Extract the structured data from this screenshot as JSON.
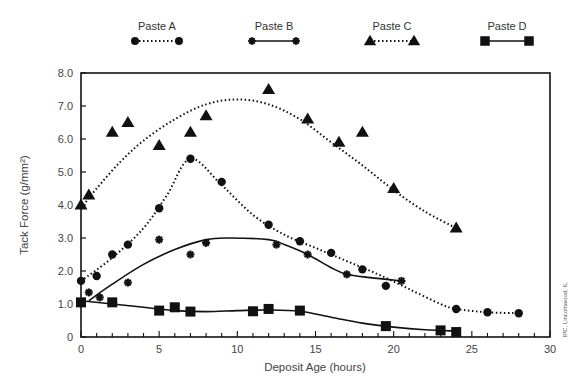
{
  "chart_data": {
    "type": "scatter",
    "title": "",
    "xlabel": "Deposit Age (hours)",
    "ylabel": "Tack Force (g/mm²)",
    "xlim": [
      0,
      30
    ],
    "ylim": [
      0,
      8.0
    ],
    "xticks": [
      0,
      5,
      10,
      15,
      20,
      25,
      30
    ],
    "xtick_labels": [
      "0",
      "5",
      "10",
      "15",
      "20",
      "25",
      "30"
    ],
    "yticks": [
      0,
      1,
      2,
      3,
      4,
      5,
      6,
      7,
      8
    ],
    "ytick_labels": [
      "0",
      "1.0",
      "2.0",
      "3.0",
      "4.0",
      "5.0",
      "6.0",
      "7.0",
      "8.0"
    ],
    "grid": false,
    "legend_position": "top",
    "annotation": "IPC, Lincolnwood, IL",
    "series": [
      {
        "name": "Paste A",
        "marker": "circle",
        "line": "dotted",
        "points": [
          [
            0,
            1.7
          ],
          [
            1,
            1.85
          ],
          [
            2,
            2.5
          ],
          [
            3,
            2.8
          ],
          [
            5,
            3.9
          ],
          [
            7,
            5.4
          ],
          [
            9,
            4.7
          ],
          [
            12,
            3.4
          ],
          [
            14,
            2.9
          ],
          [
            16,
            2.55
          ],
          [
            18,
            2.05
          ],
          [
            19.5,
            1.55
          ],
          [
            24,
            0.85
          ],
          [
            26,
            0.75
          ],
          [
            28,
            0.72
          ]
        ],
        "curve": [
          [
            0,
            1.7
          ],
          [
            2,
            2.4
          ],
          [
            4,
            3.3
          ],
          [
            5.5,
            4.3
          ],
          [
            7,
            5.4
          ],
          [
            9,
            4.6
          ],
          [
            11,
            3.7
          ],
          [
            13,
            3.1
          ],
          [
            15,
            2.7
          ],
          [
            17,
            2.3
          ],
          [
            19,
            1.9
          ],
          [
            21,
            1.45
          ],
          [
            23,
            1.0
          ],
          [
            24,
            0.85
          ],
          [
            26,
            0.75
          ],
          [
            28,
            0.72
          ]
        ]
      },
      {
        "name": "Paste B",
        "marker": "asterisk",
        "line": "solid",
        "points": [
          [
            0.5,
            1.35
          ],
          [
            1.2,
            1.2
          ],
          [
            3,
            1.65
          ],
          [
            5,
            2.95
          ],
          [
            7,
            2.5
          ],
          [
            8,
            2.85
          ],
          [
            12.5,
            2.8
          ],
          [
            14.5,
            2.5
          ],
          [
            17,
            1.9
          ],
          [
            20.5,
            1.7
          ]
        ],
        "curve": [
          [
            0.5,
            1.1
          ],
          [
            2,
            1.6
          ],
          [
            4,
            2.2
          ],
          [
            6,
            2.65
          ],
          [
            8,
            2.95
          ],
          [
            9.5,
            3.0
          ],
          [
            12,
            2.95
          ],
          [
            13,
            2.8
          ],
          [
            14.5,
            2.5
          ],
          [
            16,
            2.1
          ],
          [
            17,
            1.9
          ],
          [
            18.5,
            1.8
          ],
          [
            20.5,
            1.7
          ]
        ]
      },
      {
        "name": "Paste C",
        "marker": "triangle",
        "line": "dotted",
        "points": [
          [
            0,
            4.0
          ],
          [
            0.5,
            4.3
          ],
          [
            2,
            6.2
          ],
          [
            3,
            6.5
          ],
          [
            5,
            5.8
          ],
          [
            7,
            6.2
          ],
          [
            8,
            6.7
          ],
          [
            12,
            7.5
          ],
          [
            14.5,
            6.6
          ],
          [
            16.5,
            5.9
          ],
          [
            18,
            6.2
          ],
          [
            20,
            4.5
          ],
          [
            24,
            3.3
          ]
        ],
        "curve": [
          [
            0,
            3.9
          ],
          [
            1,
            4.5
          ],
          [
            2.5,
            5.3
          ],
          [
            4,
            5.95
          ],
          [
            6,
            6.6
          ],
          [
            8,
            7.05
          ],
          [
            10,
            7.2
          ],
          [
            12,
            7.05
          ],
          [
            14,
            6.6
          ],
          [
            16,
            5.9
          ],
          [
            18,
            5.2
          ],
          [
            20,
            4.45
          ],
          [
            22,
            3.8
          ],
          [
            24,
            3.3
          ]
        ]
      },
      {
        "name": "Paste D",
        "marker": "square",
        "line": "solid",
        "points": [
          [
            0,
            1.05
          ],
          [
            2,
            1.05
          ],
          [
            5,
            0.8
          ],
          [
            6,
            0.9
          ],
          [
            7,
            0.77
          ],
          [
            11,
            0.78
          ],
          [
            12,
            0.85
          ],
          [
            14,
            0.8
          ],
          [
            19.5,
            0.33
          ],
          [
            23,
            0.2
          ],
          [
            24,
            0.15
          ]
        ],
        "curve": [
          [
            0,
            1.1
          ],
          [
            2,
            1.0
          ],
          [
            4,
            0.9
          ],
          [
            6,
            0.8
          ],
          [
            8,
            0.77
          ],
          [
            10,
            0.8
          ],
          [
            12,
            0.82
          ],
          [
            14,
            0.78
          ],
          [
            16,
            0.6
          ],
          [
            18,
            0.42
          ],
          [
            20,
            0.3
          ],
          [
            22,
            0.22
          ],
          [
            24,
            0.18
          ]
        ]
      }
    ]
  }
}
